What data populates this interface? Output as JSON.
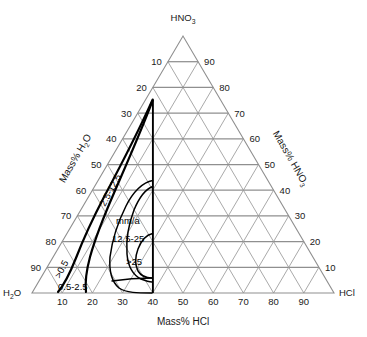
{
  "figure": {
    "type": "ternary-diagram",
    "title_bottom_axis": "Mass% HCl",
    "corners": {
      "top": "HNO",
      "top_sub": "3",
      "bottom_left": "H",
      "bottom_left_sub": "2",
      "bottom_left_tail": "O",
      "bottom_right": "HCl"
    },
    "axis_labels": {
      "left": "Mass% H",
      "left_sub": "2",
      "left_tail": "O",
      "right": "Mass% HNO",
      "right_sub": "3",
      "bottom": "Mass% HCl"
    },
    "colors": {
      "grid": "#9a9a9a",
      "grid_horizontal": "#8f8f8f",
      "contour": "#000000",
      "text": "#1a1a1a",
      "background": "#ffffff"
    }
  },
  "ticks": {
    "bottom": [
      "10",
      "20",
      "30",
      "40",
      "50",
      "60",
      "70",
      "80",
      "90"
    ],
    "left": [
      "10",
      "20",
      "30",
      "40",
      "50",
      "60",
      "70",
      "80",
      "90"
    ],
    "right": [
      "90",
      "80",
      "70",
      "60",
      "50",
      "40",
      "30",
      "20",
      "10"
    ]
  },
  "chart_data": {
    "type": "ternary-contour",
    "title": "Mass% HCl",
    "xlabel": "Mass% HCl",
    "ylabel": "Mass% HNO3",
    "zlabel": "Mass% H2O",
    "units": "mm/a",
    "axis_range": [
      0,
      100
    ],
    "grid": true,
    "legend": "inline-labels",
    "unit_label": "mm/a",
    "contour_labels": [
      ">0.5",
      "0.5-2.5",
      "2.5-12.5",
      "12.5-25",
      ">25"
    ],
    "contours": [
      {
        "label": ">0.5",
        "label_pos": {
          "hcl": 7,
          "hno3": 4
        },
        "bands": "outermost corrosion rate contour"
      },
      {
        "label": "0.5-2.5",
        "label_pos": {
          "hcl": 14,
          "hno3": 1
        },
        "bands": "second contour band"
      },
      {
        "label": "2.5-12.5",
        "label_pos": {
          "hcl": 20,
          "hno3": 22
        },
        "bands": "third contour band"
      },
      {
        "label": "12.5-25",
        "label_pos": {
          "hcl": 28,
          "hno3": 13
        },
        "bands": "fourth contour band"
      },
      {
        "label": ">25",
        "label_pos": {
          "hcl": 33,
          "hno3": 6
        },
        "bands": "innermost lobe, highest corrosion rate"
      }
    ],
    "boundary_line": {
      "hcl": 38,
      "note": "vertical constant-HCl boundary"
    }
  }
}
